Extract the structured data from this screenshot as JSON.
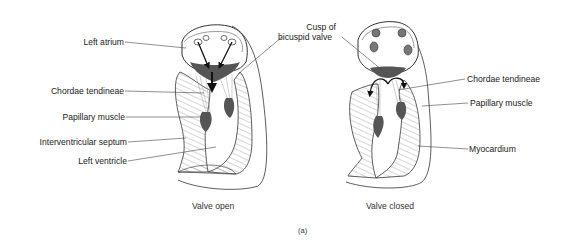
{
  "figure": {
    "panel_label": "(a)",
    "panels": [
      {
        "caption": "Valve open",
        "labels": {
          "left_atrium": "Left atrium",
          "chordae_tendineae": "Chordae tendineae",
          "papillary_muscle": "Papillary muscle",
          "interventricular_septum": "Interventricular septum",
          "left_ventricle": "Left ventricle"
        }
      },
      {
        "caption": "Valve closed",
        "labels": {
          "cusp_line1": "Cusp of",
          "cusp_line2": "bicuspid valve",
          "chordae_tendineae": "Chordae tendineae",
          "papillary_muscle": "Papillary muscle",
          "myocardium": "Myocardium"
        }
      }
    ],
    "colors": {
      "line": "#333333",
      "fill_dark": "#555555",
      "hatch": "#777777"
    }
  }
}
